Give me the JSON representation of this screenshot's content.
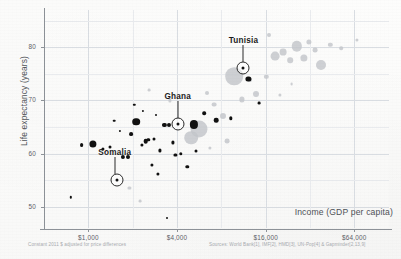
{
  "chart_data": {
    "type": "scatter",
    "title": "",
    "xlabel": "Income (GDP per capita)",
    "ylabel": "Life expectancy (years)",
    "xscale": "log",
    "xlim": [
      500,
      110000
    ],
    "ylim": [
      46,
      87
    ],
    "grid": true,
    "legend": null,
    "xticks": [
      {
        "value": 1000,
        "label": "$1,000"
      },
      {
        "value": 4000,
        "label": "$4,000"
      },
      {
        "value": 16000,
        "label": "$16,000"
      },
      {
        "value": 64000,
        "label": "$64,000"
      }
    ],
    "yticks": [
      {
        "value": 50,
        "label": "50"
      },
      {
        "value": 60,
        "label": "60"
      },
      {
        "value": 70,
        "label": "70"
      },
      {
        "value": 80,
        "label": "80"
      }
    ],
    "annotations": [
      {
        "name": "Somalia",
        "x": 1560,
        "y": 55.0,
        "label_dx": -2,
        "label_dy": -26
      },
      {
        "name": "Ghana",
        "x": 4050,
        "y": 65.5,
        "label_dx": 0,
        "label_dy": -26
      },
      {
        "name": "Tunisia",
        "x": 11300,
        "y": 76.0,
        "label_dx": 0,
        "label_dy": -26
      }
    ],
    "footnote_left": "Constant 2011 $ adjusted for price differences",
    "footnote_right": "Sources: World Bank[1], IMF[2], HMD[3], UN-Pop[4] & Gapminder[2,13,9]",
    "series": [
      {
        "name": "countries-dark",
        "color": "#111111",
        "points": [
          {
            "x": 1080,
            "y": 61.8,
            "r": 3.6
          },
          {
            "x": 900,
            "y": 61.6,
            "r": 1.9
          },
          {
            "x": 1250,
            "y": 60.8,
            "r": 1.6
          },
          {
            "x": 1400,
            "y": 61.2,
            "r": 1.5
          },
          {
            "x": 1720,
            "y": 59.4,
            "r": 2.1
          },
          {
            "x": 1850,
            "y": 59.3,
            "r": 2.0
          },
          {
            "x": 1960,
            "y": 63.7,
            "r": 1.9
          },
          {
            "x": 2120,
            "y": 66.0,
            "r": 3.8
          },
          {
            "x": 2300,
            "y": 61.6,
            "r": 1.6
          },
          {
            "x": 2450,
            "y": 62.3,
            "r": 2.3
          },
          {
            "x": 2560,
            "y": 62.6,
            "r": 1.7
          },
          {
            "x": 2700,
            "y": 57.9,
            "r": 1.6
          },
          {
            "x": 2800,
            "y": 62.8,
            "r": 1.5
          },
          {
            "x": 2950,
            "y": 56.2,
            "r": 1.6
          },
          {
            "x": 3050,
            "y": 60.6,
            "r": 1.6
          },
          {
            "x": 3280,
            "y": 65.4,
            "r": 2.1
          },
          {
            "x": 3550,
            "y": 65.4,
            "r": 2.0
          },
          {
            "x": 3750,
            "y": 62.1,
            "r": 1.6
          },
          {
            "x": 3900,
            "y": 59.7,
            "r": 1.6
          },
          {
            "x": 4250,
            "y": 60.0,
            "r": 1.7
          },
          {
            "x": 4700,
            "y": 57.5,
            "r": 1.7
          },
          {
            "x": 5200,
            "y": 65.5,
            "r": 4.1
          },
          {
            "x": 5400,
            "y": 60.4,
            "r": 1.5
          },
          {
            "x": 6100,
            "y": 67.6,
            "r": 1.8
          },
          {
            "x": 7400,
            "y": 66.3,
            "r": 2.3
          },
          {
            "x": 9300,
            "y": 66.6,
            "r": 1.7
          },
          {
            "x": 12200,
            "y": 74.0,
            "r": 2.6
          },
          {
            "x": 14500,
            "y": 69.5,
            "r": 1.4
          },
          {
            "x": 760,
            "y": 51.8,
            "r": 1.2
          },
          {
            "x": 1500,
            "y": 66.2,
            "r": 1.3
          },
          {
            "x": 2050,
            "y": 69.2,
            "r": 1.2
          },
          {
            "x": 3400,
            "y": 47.8,
            "r": 1.0
          },
          {
            "x": 2350,
            "y": 68.0,
            "r": 1.1
          },
          {
            "x": 1630,
            "y": 64.3,
            "r": 1.1
          },
          {
            "x": 2900,
            "y": 67.2,
            "r": 1.0
          }
        ]
      },
      {
        "name": "countries-light",
        "color": "#c3c6ca",
        "points": [
          {
            "x": 5600,
            "y": 64.6,
            "r": 8.5
          },
          {
            "x": 5000,
            "y": 63.0,
            "r": 6.8
          },
          {
            "x": 8200,
            "y": 67.0,
            "r": 3.0
          },
          {
            "x": 9800,
            "y": 74.6,
            "r": 8.8
          },
          {
            "x": 7100,
            "y": 69.2,
            "r": 2.4
          },
          {
            "x": 12500,
            "y": 73.8,
            "r": 2.0
          },
          {
            "x": 13800,
            "y": 71.2,
            "r": 3.0
          },
          {
            "x": 16200,
            "y": 74.4,
            "r": 2.2
          },
          {
            "x": 18500,
            "y": 78.4,
            "r": 4.4
          },
          {
            "x": 21000,
            "y": 79.1,
            "r": 3.4
          },
          {
            "x": 23500,
            "y": 77.6,
            "r": 2.8
          },
          {
            "x": 26000,
            "y": 80.2,
            "r": 5.2
          },
          {
            "x": 29000,
            "y": 78.0,
            "r": 3.6
          },
          {
            "x": 31500,
            "y": 81.0,
            "r": 2.6
          },
          {
            "x": 34500,
            "y": 79.4,
            "r": 2.4
          },
          {
            "x": 38000,
            "y": 76.6,
            "r": 5.0
          },
          {
            "x": 44000,
            "y": 80.5,
            "r": 2.2
          },
          {
            "x": 52000,
            "y": 79.8,
            "r": 1.8
          },
          {
            "x": 16800,
            "y": 82.3,
            "r": 2.0
          },
          {
            "x": 11000,
            "y": 70.2,
            "r": 2.6
          },
          {
            "x": 6400,
            "y": 71.4,
            "r": 2.0
          },
          {
            "x": 3600,
            "y": 70.0,
            "r": 1.6
          },
          {
            "x": 2600,
            "y": 72.0,
            "r": 1.4
          },
          {
            "x": 1900,
            "y": 53.6,
            "r": 1.6
          },
          {
            "x": 2250,
            "y": 51.0,
            "r": 1.4
          },
          {
            "x": 8800,
            "y": 62.4,
            "r": 2.4
          },
          {
            "x": 6700,
            "y": 61.0,
            "r": 1.6
          },
          {
            "x": 20000,
            "y": 71.0,
            "r": 1.6
          },
          {
            "x": 67000,
            "y": 81.3,
            "r": 1.6
          },
          {
            "x": 24000,
            "y": 73.0,
            "r": 1.4
          }
        ]
      }
    ]
  }
}
